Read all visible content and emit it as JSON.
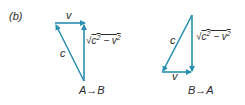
{
  "part_label": "(b)",
  "colors": {
    "vector": "#2a8fb0",
    "text": "#2a2a2a"
  },
  "triangles": [
    {
      "name": "A-to-B",
      "caption": "A→B",
      "v_label": "v",
      "c_label": "c",
      "side_label": {
        "radical": "√",
        "expr_c": "c",
        "exp": "2",
        "minus": " − v",
        "exp2": "2"
      }
    },
    {
      "name": "B-to-A",
      "caption": "B→A",
      "v_label": "v",
      "c_label": "c",
      "side_label": {
        "radical": "√",
        "expr_c": "c",
        "exp": "2",
        "minus": " − v",
        "exp2": "2"
      }
    }
  ]
}
